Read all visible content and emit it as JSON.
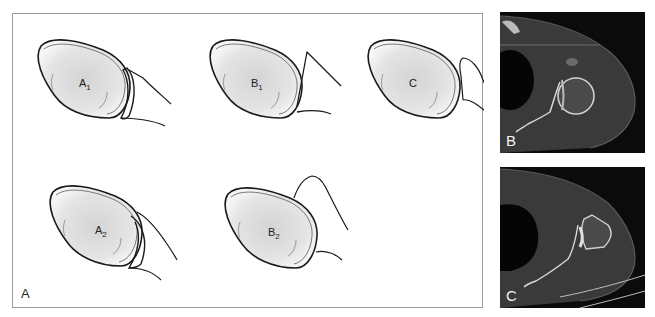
{
  "figure": {
    "panel_a": {
      "label": "A",
      "shapes": [
        {
          "id": "A1",
          "letter": "A",
          "sub": "1"
        },
        {
          "id": "B1",
          "letter": "B",
          "sub": "1"
        },
        {
          "id": "C",
          "letter": "C",
          "sub": ""
        },
        {
          "id": "A2",
          "letter": "A",
          "sub": "2"
        },
        {
          "id": "B2",
          "letter": "B",
          "sub": "2"
        }
      ]
    },
    "panel_b": {
      "label": "B",
      "type": "axial CT scan of shoulder"
    },
    "panel_c": {
      "label": "C",
      "type": "axial CT scan of shoulder"
    },
    "colors": {
      "border": "#9a9a9a",
      "outline": "#1a1a1a",
      "fill_center": "#d9d9d9",
      "ct_background": "#0b0b0b",
      "ct_tissue": "#3a3a3a",
      "ct_bone": "#d8d8d8"
    }
  }
}
